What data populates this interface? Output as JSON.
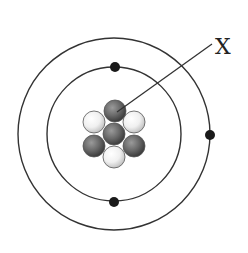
{
  "diagram": {
    "label": "X",
    "center": [
      114,
      134
    ],
    "orbits": [
      {
        "name": "inner-shell",
        "radius": 67
      },
      {
        "name": "outer-shell",
        "radius": 96
      }
    ],
    "electrons": [
      {
        "shell": "inner",
        "cx": 115,
        "cy": 67
      },
      {
        "shell": "inner",
        "cx": 114,
        "cy": 202
      },
      {
        "shell": "outer",
        "cx": 210,
        "cy": 135
      }
    ],
    "nucleus": {
      "particles": [
        {
          "type": "dark",
          "cx": 115,
          "cy": 111
        },
        {
          "type": "light",
          "cx": 94,
          "cy": 122
        },
        {
          "type": "light",
          "cx": 134,
          "cy": 122
        },
        {
          "type": "dark",
          "cx": 94,
          "cy": 146
        },
        {
          "type": "dark",
          "cx": 134,
          "cy": 146
        },
        {
          "type": "light",
          "cx": 114,
          "cy": 157
        },
        {
          "type": "dark",
          "cx": 114,
          "cy": 134
        }
      ],
      "dark_count": 4,
      "light_count": 3
    },
    "pointer": {
      "from": [
        117,
        112
      ],
      "to": [
        212,
        44
      ],
      "target": "dark nucleus particle (top)"
    },
    "colors": {
      "line": "#333333",
      "electron": "#1a1a1a",
      "dark_particle": "#6e6e6e",
      "light_particle": "#f2f2f2",
      "background": "#ffffff"
    }
  }
}
